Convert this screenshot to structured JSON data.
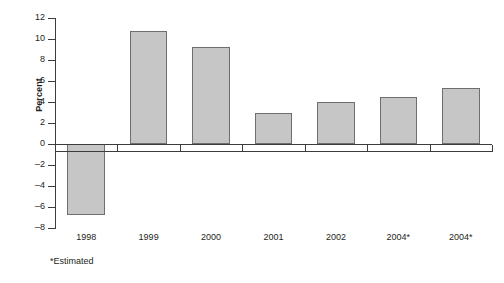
{
  "chart_data": {
    "type": "bar",
    "title": "",
    "xlabel": "",
    "ylabel": "Percent",
    "categories": [
      "1998",
      "1999",
      "2000",
      "2001",
      "2002",
      "2004*",
      "2004*"
    ],
    "values": [
      -6.8,
      10.8,
      9.2,
      3.0,
      4.0,
      4.5,
      5.3
    ],
    "ylim": [
      -8,
      12
    ],
    "ytick_labels": [
      "12",
      "10",
      "8",
      "6",
      "4",
      "2",
      "0",
      "–2",
      "–4",
      "–6",
      "–8"
    ],
    "ytick_values": [
      12,
      10,
      8,
      6,
      4,
      2,
      0,
      -2,
      -4,
      -6,
      -8
    ],
    "grid": false,
    "legend": "none",
    "footnote": "*Estimated",
    "bar_fill_color": "#c6c6c6",
    "bar_border_color": "#6e6e6e",
    "axis_color": "#3c3c3c",
    "background_color": "#ffffff"
  }
}
